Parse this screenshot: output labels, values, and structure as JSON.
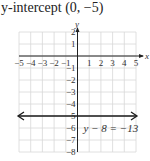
{
  "title": "y-intercept (0, −5)",
  "chart_data": {
    "type": "line",
    "xlabel": "x",
    "ylabel": "y",
    "xlim": [
      -5,
      5
    ],
    "ylim": [
      -8,
      2
    ],
    "grid": true,
    "x_ticks": [
      -5,
      -4,
      -3,
      -2,
      -1,
      1,
      2,
      3,
      4,
      5
    ],
    "y_ticks": [
      2,
      1,
      -1,
      -2,
      -3,
      -4,
      -5,
      -6,
      -7,
      -8
    ],
    "series": [
      {
        "name": "y − 8 = −13",
        "equation": "y = -5",
        "x": [
          -5,
          5
        ],
        "y": [
          -5,
          -5
        ],
        "arrows": "both"
      }
    ],
    "annotations": [
      {
        "text": "y − 8 = −13",
        "x": 2.5,
        "y": -6
      }
    ]
  },
  "labels": {
    "x_axis": "x",
    "y_axis": "y",
    "equation": "y − 8 = −13",
    "x_ticks": [
      "−5",
      "−4",
      "−3",
      "−2",
      "−1",
      "1",
      "2",
      "3",
      "4",
      "5"
    ],
    "y_ticks": [
      "2",
      "1",
      "−1",
      "−2",
      "−3",
      "−4",
      "5",
      "−6",
      "−7",
      "−8"
    ]
  },
  "colors": {
    "grid": "#d8d8d8",
    "axis": "#222222",
    "line": "#1a1a1a",
    "text": "#333333"
  }
}
